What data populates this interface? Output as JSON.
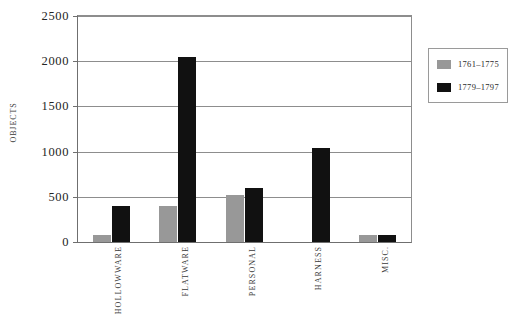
{
  "chart_data": {
    "type": "bar",
    "title": "",
    "xlabel": "",
    "ylabel": "OBJECTS",
    "ylim": [
      0,
      2500
    ],
    "yticks": [
      0,
      500,
      1000,
      1500,
      2000,
      2500
    ],
    "ytick_labels": [
      "0",
      "500",
      "1000",
      "1500",
      "2000",
      "2500"
    ],
    "grid": true,
    "legend_position": "right",
    "categories": [
      "HOLLOWWARE",
      "FLATWARE",
      "PERSONAL",
      "HARNESS",
      "MISC."
    ],
    "series": [
      {
        "name": "1761–1775",
        "color": "#989898",
        "values": [
          80,
          400,
          520,
          0,
          80
        ]
      },
      {
        "name": "1779–1797",
        "color": "#111111",
        "values": [
          400,
          2050,
          600,
          1040,
          80
        ]
      }
    ]
  }
}
